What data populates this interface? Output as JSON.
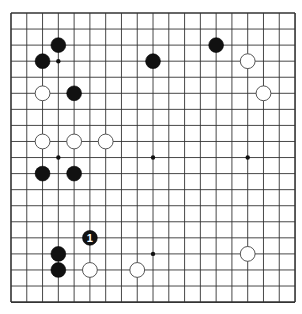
{
  "board": {
    "size": 19,
    "origin_x": 11,
    "origin_y": 13,
    "spacing_x": 15.78,
    "spacing_y": 16.06,
    "line_color": "#333333",
    "background": "#ffffff",
    "hoshi": [
      [
        3,
        3
      ],
      [
        9,
        3
      ],
      [
        15,
        3
      ],
      [
        3,
        9
      ],
      [
        9,
        9
      ],
      [
        15,
        9
      ],
      [
        3,
        15
      ],
      [
        9,
        15
      ],
      [
        15,
        15
      ]
    ],
    "stones": [
      {
        "color": "black",
        "col": 3,
        "row": 2
      },
      {
        "color": "black",
        "col": 2,
        "row": 3
      },
      {
        "color": "black",
        "col": 9,
        "row": 3
      },
      {
        "color": "black",
        "col": 13,
        "row": 2
      },
      {
        "color": "white",
        "col": 15,
        "row": 3
      },
      {
        "color": "white",
        "col": 16,
        "row": 5
      },
      {
        "color": "white",
        "col": 2,
        "row": 5
      },
      {
        "color": "black",
        "col": 4,
        "row": 5
      },
      {
        "color": "white",
        "col": 2,
        "row": 8
      },
      {
        "color": "white",
        "col": 4,
        "row": 8
      },
      {
        "color": "white",
        "col": 6,
        "row": 8
      },
      {
        "color": "black",
        "col": 2,
        "row": 10
      },
      {
        "color": "black",
        "col": 4,
        "row": 10
      },
      {
        "color": "black",
        "col": 5,
        "row": 14,
        "label": "1"
      },
      {
        "color": "black",
        "col": 3,
        "row": 15
      },
      {
        "color": "black",
        "col": 3,
        "row": 16
      },
      {
        "color": "white",
        "col": 5,
        "row": 16
      },
      {
        "color": "white",
        "col": 8,
        "row": 16
      },
      {
        "color": "white",
        "col": 15,
        "row": 15
      }
    ]
  }
}
